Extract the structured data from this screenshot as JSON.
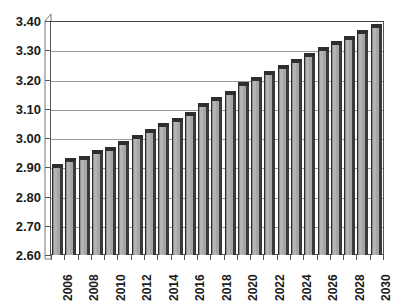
{
  "chart_data": {
    "type": "bar",
    "title": "",
    "subtitle": "",
    "xlabel": "",
    "ylabel": "",
    "grid": true,
    "legend": "none",
    "ylim": [
      2.6,
      3.4
    ],
    "ytick_step": 0.1,
    "ytick_labels": [
      "3.40",
      "3.30",
      "3.20",
      "3.10",
      "3.00",
      "2.90",
      "2.80",
      "2.70",
      "2.60"
    ],
    "ytick_values": [
      3.4,
      3.3,
      3.2,
      3.1,
      3.0,
      2.9,
      2.8,
      2.7,
      2.6
    ],
    "xtick_labels": [
      "2006",
      "2008",
      "2010",
      "2012",
      "2014",
      "2016",
      "2018",
      "2020",
      "2022",
      "2024",
      "2026",
      "2028",
      "2030"
    ],
    "xtick_label_rotation": -90,
    "xtick_label_interval": 2,
    "categories": [
      "2006",
      "2007",
      "2008",
      "2009",
      "2010",
      "2011",
      "2012",
      "2013",
      "2014",
      "2015",
      "2016",
      "2017",
      "2018",
      "2019",
      "2020",
      "2021",
      "2022",
      "2023",
      "2024",
      "2025",
      "2026",
      "2027",
      "2028",
      "2029",
      "2030"
    ],
    "values": [
      2.91,
      2.93,
      2.94,
      2.96,
      2.97,
      2.99,
      3.01,
      3.03,
      3.05,
      3.07,
      3.09,
      3.12,
      3.14,
      3.16,
      3.19,
      3.21,
      3.23,
      3.25,
      3.27,
      3.29,
      3.31,
      3.33,
      3.35,
      3.37,
      3.39
    ],
    "bar_fill_color": "#a9a9a9",
    "bar_top_color": "#2e2e2e",
    "bar_side_color": "#3a3a3a",
    "gridline_color": "#9a9a9a",
    "axis_color": "#555555",
    "background_color": "#ffffff",
    "text_color": "#1a1a1a"
  }
}
